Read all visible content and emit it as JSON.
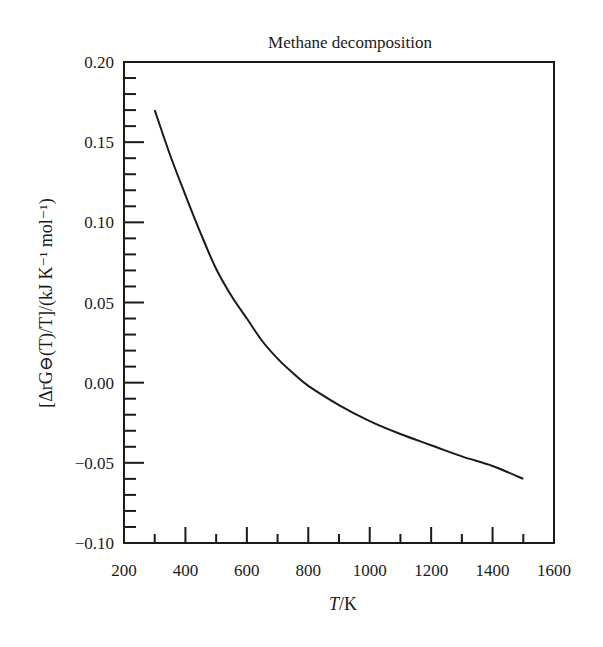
{
  "chart_data": {
    "type": "line",
    "title": "Methane decomposition",
    "xlabel": "T/K",
    "ylabel": "[ΔrG⊖(T)/T]/(kJ K⁻¹ mol⁻¹)",
    "xlim": [
      200,
      1600
    ],
    "ylim": [
      -0.1,
      0.2
    ],
    "x_ticks": [
      200,
      400,
      600,
      800,
      1000,
      1200,
      1400,
      1600
    ],
    "x_tick_labels": [
      "200",
      "400",
      "600",
      "800",
      "1000",
      "1200",
      "1400",
      "1600"
    ],
    "x_minor_step": 100,
    "y_ticks": [
      0.2,
      0.15,
      0.1,
      0.05,
      0.0,
      -0.05,
      -0.1
    ],
    "y_tick_labels": [
      "0.20",
      "0.15",
      "0.10",
      "0.05",
      "0.00",
      "−0.05",
      "−0.10"
    ],
    "y_minor_step": 0.01,
    "grid": false,
    "legend": null,
    "series": [
      {
        "name": "Methane decomposition",
        "x": [
          300,
          350,
          400,
          450,
          500,
          550,
          600,
          650,
          700,
          750,
          800,
          900,
          1000,
          1100,
          1200,
          1300,
          1400,
          1500
        ],
        "values": [
          0.17,
          0.142,
          0.117,
          0.093,
          0.071,
          0.054,
          0.04,
          0.026,
          0.015,
          0.006,
          -0.002,
          -0.014,
          -0.024,
          -0.032,
          -0.039,
          -0.046,
          -0.052,
          -0.06
        ]
      }
    ],
    "line_color": "#1a1a1a"
  }
}
